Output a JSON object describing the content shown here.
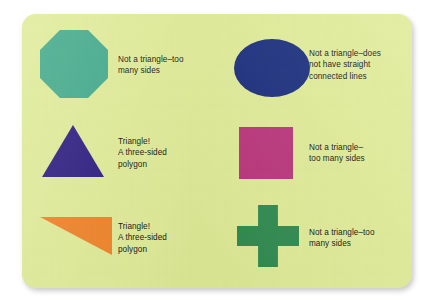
{
  "card": {
    "background_color": "#dfeb96",
    "page_background_color": "#ffffff"
  },
  "items": [
    {
      "shape_name": "octagon",
      "shape_color": "#3fa888",
      "label": "Not a triangle–too\nmany sides"
    },
    {
      "shape_name": "ellipse",
      "shape_color": "#152a7a",
      "label": "Not a triangle–does\nnot have straight\nconnected lines"
    },
    {
      "shape_name": "triangle-equilateral",
      "shape_color": "#29187e",
      "label": "Triangle!\nA three-sided\npolygon"
    },
    {
      "shape_name": "square",
      "shape_color": "#b9337a",
      "label": "Not a triangle–\ntoo many sides"
    },
    {
      "shape_name": "triangle-right",
      "shape_color": "#ef8024",
      "label": "Triangle!\nA three-sided\npolygon"
    },
    {
      "shape_name": "cross",
      "shape_color": "#2e8a4e",
      "label": "Not a triangle–too\nmany sides"
    }
  ]
}
